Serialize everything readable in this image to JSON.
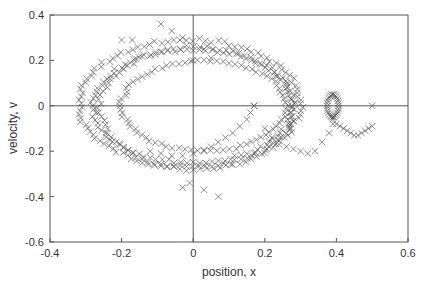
{
  "chart_data": {
    "type": "scatter",
    "title": "",
    "xlabel": "position, x",
    "ylabel": "velocity, v",
    "xlim": [
      -0.4,
      0.6
    ],
    "ylim": [
      -0.6,
      0.4
    ],
    "xticks": [
      "-0.4",
      "-0.2",
      "0",
      "0.2",
      "0.4",
      "0.6"
    ],
    "yticks": [
      "0.4",
      "0.2",
      "0",
      "-0.2",
      "-0.4",
      "-0.6"
    ],
    "grid": false,
    "zero_lines": true,
    "legend": null,
    "marker": "x",
    "marker_color": "#555555",
    "series": [
      {
        "name": "outer orbit",
        "shape": "ellipse",
        "center": [
          -0.01,
          0.01
        ],
        "radii": [
          0.31,
          0.28
        ],
        "n_points": 110
      },
      {
        "name": "middle orbit",
        "shape": "ellipse",
        "center": [
          0.0,
          0.0
        ],
        "radii": [
          0.28,
          0.25
        ],
        "n_points": 100
      },
      {
        "name": "second orbit",
        "shape": "ellipse",
        "center": [
          0.01,
          -0.01
        ],
        "radii": [
          0.27,
          0.27
        ],
        "n_points": 90
      },
      {
        "name": "inner orbit",
        "shape": "ellipse",
        "center": [
          0.03,
          0.0
        ],
        "radii": [
          0.23,
          0.2
        ],
        "n_points": 80
      },
      {
        "name": "inner spiral",
        "shape": "points",
        "points": [
          [
            0.17,
            0.0
          ],
          [
            0.16,
            -0.03
          ],
          [
            0.15,
            -0.06
          ],
          [
            0.13,
            -0.09
          ],
          [
            0.11,
            -0.12
          ],
          [
            0.09,
            -0.14
          ],
          [
            0.07,
            -0.16
          ],
          [
            0.05,
            -0.18
          ],
          [
            0.03,
            -0.2
          ],
          [
            0.0,
            -0.21
          ],
          [
            -0.03,
            -0.22
          ],
          [
            -0.06,
            -0.22
          ],
          [
            -0.09,
            -0.21
          ],
          [
            -0.12,
            -0.2
          ],
          [
            0.2,
            -0.1
          ],
          [
            0.22,
            -0.14
          ],
          [
            0.24,
            -0.17
          ],
          [
            0.26,
            -0.18
          ],
          [
            0.28,
            -0.19
          ],
          [
            0.3,
            -0.2
          ],
          [
            0.32,
            -0.21
          ],
          [
            0.34,
            -0.2
          ],
          [
            0.36,
            -0.16
          ],
          [
            0.38,
            -0.12
          ],
          [
            0.39,
            -0.08
          ]
        ]
      },
      {
        "name": "right loop",
        "shape": "ellipse",
        "center": [
          0.39,
          0.0
        ],
        "radii": [
          0.016,
          0.05
        ],
        "n_points": 28
      },
      {
        "name": "tail",
        "shape": "points",
        "points": [
          [
            0.39,
            -0.06
          ],
          [
            0.4,
            -0.08
          ],
          [
            0.41,
            -0.09
          ],
          [
            0.42,
            -0.1
          ],
          [
            0.43,
            -0.11
          ],
          [
            0.44,
            -0.12
          ],
          [
            0.45,
            -0.13
          ],
          [
            0.46,
            -0.13
          ],
          [
            0.47,
            -0.12
          ],
          [
            0.48,
            -0.11
          ],
          [
            0.49,
            -0.1
          ],
          [
            0.5,
            -0.09
          ]
        ]
      },
      {
        "name": "outliers",
        "shape": "points",
        "points": [
          [
            -0.09,
            0.36
          ],
          [
            -0.06,
            0.33
          ],
          [
            -0.03,
            0.3
          ],
          [
            0.03,
            0.25
          ],
          [
            0.5,
            0.0
          ],
          [
            0.17,
            0.0
          ],
          [
            -0.03,
            -0.36
          ],
          [
            -0.01,
            -0.34
          ],
          [
            0.03,
            -0.37
          ],
          [
            0.07,
            -0.4
          ],
          [
            -0.2,
            0.29
          ],
          [
            -0.17,
            0.29
          ],
          [
            0.0,
            0.2
          ],
          [
            0.05,
            0.21
          ]
        ]
      }
    ]
  }
}
